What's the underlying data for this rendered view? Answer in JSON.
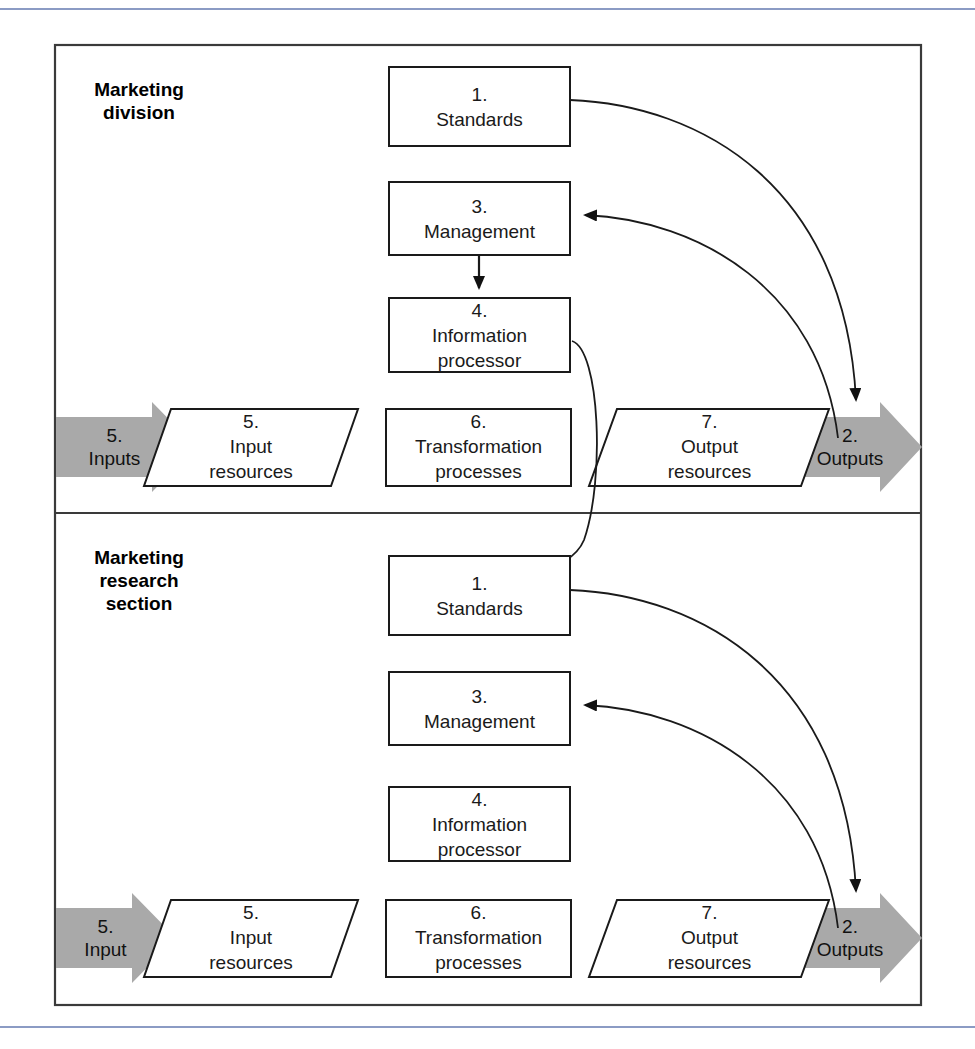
{
  "page": {
    "rule_color": "#8b9bc4",
    "frame_color": "#3a3a3a",
    "gray_arrow_color": "#a9a9a9",
    "line_color": "#1a1a1a"
  },
  "sections": [
    {
      "id": "marketing-division",
      "title_line1": "Marketing",
      "title_line2": "division",
      "title_line3": "",
      "input_arrow": {
        "num": "5.",
        "label": "Inputs"
      },
      "output_arrow": {
        "num": "2.",
        "label": "Outputs"
      },
      "boxes": [
        {
          "id": "standards",
          "num": "1.",
          "label": "Standards",
          "shape": "rect"
        },
        {
          "id": "management",
          "num": "3.",
          "label": "Management",
          "shape": "rect"
        },
        {
          "id": "information-processor",
          "num": "4.",
          "label_line1": "Information",
          "label_line2": "processor",
          "shape": "rect"
        },
        {
          "id": "input-resources",
          "num": "5.",
          "label_line1": "Input",
          "label_line2": "resources",
          "shape": "parallelogram"
        },
        {
          "id": "transformation-processes",
          "num": "6.",
          "label_line1": "Transformation",
          "label_line2": "processes",
          "shape": "rect"
        },
        {
          "id": "output-resources",
          "num": "7.",
          "label_line1": "Output",
          "label_line2": "resources",
          "shape": "parallelogram"
        }
      ]
    },
    {
      "id": "marketing-research-section",
      "title_line1": "Marketing",
      "title_line2": "research",
      "title_line3": "section",
      "input_arrow": {
        "num": "5.",
        "label": "Input"
      },
      "output_arrow": {
        "num": "2.",
        "label": "Outputs"
      },
      "boxes": [
        {
          "id": "standards",
          "num": "1.",
          "label": "Standards",
          "shape": "rect"
        },
        {
          "id": "management",
          "num": "3.",
          "label": "Management",
          "shape": "rect"
        },
        {
          "id": "information-processor",
          "num": "4.",
          "label_line1": "Information",
          "label_line2": "processor",
          "shape": "rect"
        },
        {
          "id": "input-resources",
          "num": "5.",
          "label_line1": "Input",
          "label_line2": "resources",
          "shape": "parallelogram"
        },
        {
          "id": "transformation-processes",
          "num": "6.",
          "label_line1": "Transformation",
          "label_line2": "processes",
          "shape": "rect"
        },
        {
          "id": "output-resources",
          "num": "7.",
          "label_line1": "Output",
          "label_line2": "resources",
          "shape": "parallelogram"
        }
      ]
    }
  ],
  "connectors": [
    {
      "id": "division-standards-to-outputs",
      "from": "marketing-division.standards",
      "to": "marketing-division.outputs",
      "style": "curved-arrow"
    },
    {
      "id": "division-outputs-to-management",
      "from": "marketing-division.outputs",
      "to": "marketing-division.management",
      "style": "curved-arrow"
    },
    {
      "id": "division-management-to-information-processor",
      "from": "marketing-division.management",
      "to": "marketing-division.information-processor",
      "style": "straight-arrow"
    },
    {
      "id": "division-information-processor-to-research-standards",
      "from": "marketing-division.information-processor",
      "to": "marketing-research-section.standards",
      "style": "curved-arrow"
    },
    {
      "id": "research-standards-to-outputs",
      "from": "marketing-research-section.standards",
      "to": "marketing-research-section.outputs",
      "style": "curved-arrow"
    },
    {
      "id": "research-outputs-to-management",
      "from": "marketing-research-section.outputs",
      "to": "marketing-research-section.management",
      "style": "curved-arrow"
    }
  ]
}
